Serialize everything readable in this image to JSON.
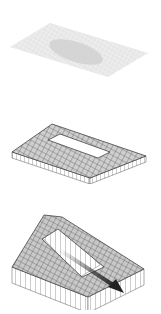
{
  "diagram": {
    "type": "isometric-voxel-sequence",
    "stages": [
      {
        "id": "stage-1",
        "description": "flat grid plate with shaded inner region",
        "plate_color": "#e6e6e6",
        "inner_color": "#cfcfcf",
        "grid_color": "#f7f7f7"
      },
      {
        "id": "stage-2",
        "description": "one-layer rectangular ring of voxels",
        "top_color": "#cfcfcf",
        "side_color": "#ffffff",
        "edge_color": "#555555"
      },
      {
        "id": "stage-3",
        "description": "extruded sloped voxel ring with direction arrow",
        "top_color": "#c8c8c8",
        "side_color": "#ffffff",
        "edge_color": "#555555",
        "arrow_color": "#222222"
      }
    ]
  }
}
